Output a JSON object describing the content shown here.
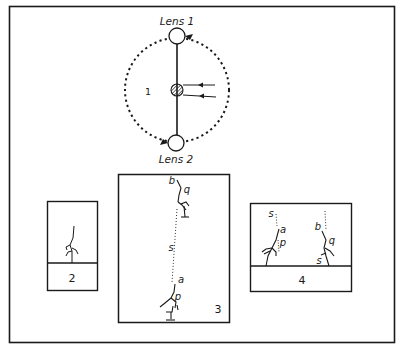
{
  "figure": {
    "panel1": {
      "number": "1",
      "lens_top": "Lens 1",
      "lens_bottom": "Lens 2"
    },
    "panel2": {
      "number": "2"
    },
    "panel3": {
      "number": "3",
      "labels": {
        "b": "b",
        "q": "q",
        "s": "s",
        "a": "a",
        "p": "p"
      }
    },
    "panel4": {
      "number": "4",
      "labels": {
        "s_left": "s",
        "a": "a",
        "p": "p",
        "b": "b",
        "q": "q",
        "s_right": "s"
      }
    }
  },
  "colors": {
    "ink": "#1a1a1a",
    "background": "#ffffff"
  }
}
